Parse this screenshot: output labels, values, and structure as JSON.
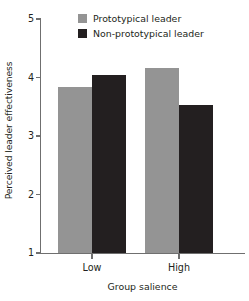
{
  "chart_data": {
    "type": "bar",
    "title": "",
    "xlabel": "Group salience",
    "ylabel": "Perceived leader effectiveness",
    "categories": [
      "Low",
      "High"
    ],
    "ylim": [
      1,
      5
    ],
    "yticks": [
      1,
      2,
      3,
      4,
      5
    ],
    "ytick_labels": [
      "1",
      "2",
      "3",
      "4",
      "5"
    ],
    "grid": false,
    "legend_position": "top-center",
    "series": [
      {
        "name": "Prototypical leader",
        "color": "#949494",
        "values": [
          3.83,
          4.17
        ]
      },
      {
        "name": "Non-prototypical leader",
        "color": "#231f20",
        "values": [
          4.05,
          3.53
        ]
      }
    ]
  },
  "legend": {
    "items": [
      {
        "label": "Prototypical leader",
        "swatch": "legend-swatch-gray"
      },
      {
        "label": "Non-prototypical leader",
        "swatch": "legend-swatch-black"
      }
    ]
  },
  "axes": {
    "y_title": "Perceived leader effectiveness",
    "x_title": "Group salience",
    "y_tick_labels": [
      "5",
      "4",
      "3",
      "2",
      "1"
    ],
    "x_tick_labels": [
      "Low",
      "High"
    ]
  }
}
